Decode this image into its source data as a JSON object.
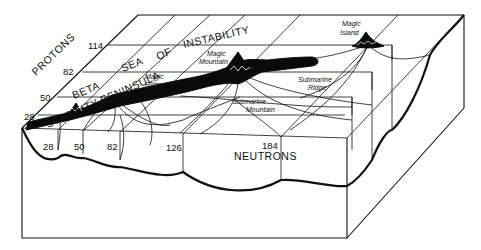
{
  "diagram": {
    "type": "3d-block-illustration",
    "axes": {
      "protons": {
        "label": "PROTONS",
        "ticks": [
          "28",
          "50",
          "82",
          "114"
        ]
      },
      "neutrons": {
        "label": "NEUTRONS",
        "ticks": [
          "28",
          "50",
          "82",
          "126",
          "184"
        ]
      }
    },
    "regions": {
      "sea": [
        "SEA",
        "OF",
        "INSTABILITY"
      ],
      "peninsula_line1": "BETA",
      "peninsula_line2": "STABILITY PENINSULA"
    },
    "features": {
      "magic_ridge": [
        "Magic",
        "Ridge"
      ],
      "magic_mountain": [
        "Magic",
        "Mountain"
      ],
      "magic_island": [
        "Magic",
        "Island"
      ],
      "submarine_ridge": [
        "Submarine",
        "Ridge"
      ],
      "submarine_mountain": [
        "Submarine",
        "Mountain"
      ]
    },
    "colors": {
      "ink": "#111111",
      "land": "#0a0a0a",
      "background": "#ffffff"
    }
  }
}
